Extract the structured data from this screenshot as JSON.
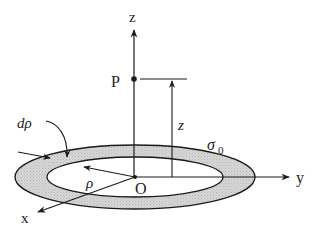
{
  "diagram": {
    "type": "charged-ring-geometry",
    "labels": {
      "z_axis": "z",
      "y_axis": "y",
      "x_axis": "x",
      "point": "P",
      "origin": "O",
      "height": "z",
      "radius": "ρ",
      "ring_width": "dρ",
      "surface_charge": "σ",
      "surface_charge_sub": "0"
    },
    "colors": {
      "stroke": "#1a1a1a",
      "ring_fill": "#cfcfcf",
      "background": "#ffffff"
    }
  }
}
